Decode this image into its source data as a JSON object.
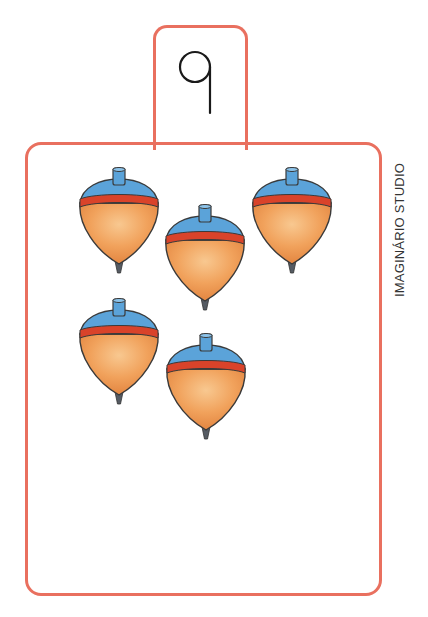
{
  "card": {
    "number": "9",
    "credit": "IMAGINÁRIO STUDIO",
    "object_name": "spinning top",
    "object_count": 5
  },
  "colors": {
    "frame": "#e9705f",
    "top_body": "#f0a55e",
    "top_body_light": "#f7c48a",
    "top_cap": "#5ba3d9",
    "top_band": "#d9432a",
    "top_tip": "#555b63",
    "outline": "#3a3a3a"
  },
  "tops": [
    {
      "x": 76,
      "y": 167
    },
    {
      "x": 162,
      "y": 204
    },
    {
      "x": 249,
      "y": 167
    },
    {
      "x": 76,
      "y": 298
    },
    {
      "x": 163,
      "y": 333
    }
  ]
}
